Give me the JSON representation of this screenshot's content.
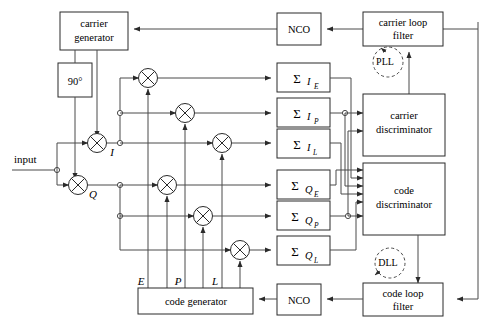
{
  "figure": {
    "type": "block-diagram"
  },
  "blocks": {
    "carrier_generator": "carrier\ngenerator",
    "carrier_generator_l1": "carrier",
    "carrier_generator_l2": "generator",
    "phase_shift": "90°",
    "carrier_discriminator_l1": "carrier",
    "carrier_discriminator_l2": "discriminator",
    "code_discriminator_l1": "code",
    "code_discriminator_l2": "discriminator",
    "carrier_loop_filter_l1": "carrier loop",
    "carrier_loop_filter_l2": "filter",
    "code_loop_filter_l1": "code loop",
    "code_loop_filter_l2": "filter",
    "nco_top": "NCO",
    "nco_bottom": "NCO",
    "code_generator": "code generator"
  },
  "signals": {
    "input": "input",
    "i_branch": "I",
    "q_branch": "Q",
    "early": "E",
    "prompt": "P",
    "late": "L"
  },
  "integrators": [
    {
      "sigma": "Σ",
      "sub": "I",
      "subsub": "E"
    },
    {
      "sigma": "Σ",
      "sub": "I",
      "subsub": "P"
    },
    {
      "sigma": "Σ",
      "sub": "I",
      "subsub": "L"
    },
    {
      "sigma": "Σ",
      "sub": "Q",
      "subsub": "E"
    },
    {
      "sigma": "Σ",
      "sub": "Q",
      "subsub": "P"
    },
    {
      "sigma": "Σ",
      "sub": "Q",
      "subsub": "L"
    }
  ],
  "loops": {
    "pll": "PLL",
    "dll": "DLL"
  },
  "colors": {
    "line": "#4a4a4a",
    "block_stroke": "#2a2a2a",
    "background": "#ffffff",
    "text": "#000000"
  }
}
